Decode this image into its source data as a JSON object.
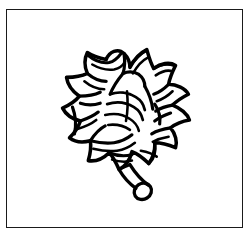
{
  "image": {
    "subject": "leafy-head-vegetable-with-stem",
    "style": "black-and-white-line-drawing",
    "alt_text": "Line drawing of a round leafy vegetable head with overlapping pointed leaves and a curved stem",
    "background_color": "#ffffff",
    "ink_color": "#000000",
    "frame": {
      "present": true,
      "border_color": "#1a1a1a",
      "border_width_px": 1.5,
      "x": 6,
      "y": 9,
      "width": 237,
      "height": 219
    },
    "caption": "",
    "elements": [
      {
        "name": "leaf-head",
        "description": "round clustered head of overlapping pointed leaves",
        "center_x": 120,
        "center_y": 115,
        "radius_px": 55
      },
      {
        "name": "stem",
        "description": "short curved stem with rounded tip extending down-right",
        "start_x": 112,
        "start_y": 158,
        "end_x": 146,
        "end_y": 185
      }
    ]
  }
}
